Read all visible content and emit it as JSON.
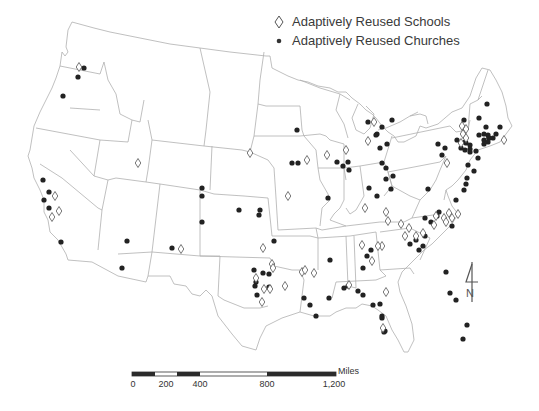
{
  "map": {
    "title": "",
    "region": "Contiguous United States",
    "colors": {
      "state_border": "#b5b5b5",
      "church_marker": "#222222",
      "school_marker": "#555555",
      "text": "#3a3a3a"
    }
  },
  "legend": {
    "items": [
      {
        "symbol": "diamond-outline",
        "label": "Adaptively Reused Schools"
      },
      {
        "symbol": "filled-dot",
        "label": "Adaptively Reused Churches"
      }
    ]
  },
  "scale_bar": {
    "unit": "Miles",
    "ticks": [
      {
        "label": "0",
        "x": 133
      },
      {
        "label": "200",
        "x": 166
      },
      {
        "label": "400",
        "x": 200
      },
      {
        "label": "800",
        "x": 267
      },
      {
        "label": "1,200",
        "x": 334
      }
    ]
  },
  "north_arrow": {
    "label": "N"
  },
  "markers": {
    "churches": [
      [
        84,
        68
      ],
      [
        78,
        77
      ],
      [
        63,
        96
      ],
      [
        43,
        180
      ],
      [
        49,
        192
      ],
      [
        44,
        200
      ],
      [
        49,
        208
      ],
      [
        61,
        242
      ],
      [
        127,
        241
      ],
      [
        122,
        268
      ],
      [
        172,
        248
      ],
      [
        202,
        222
      ],
      [
        202,
        196
      ],
      [
        202,
        188
      ],
      [
        239,
        210
      ],
      [
        260,
        210
      ],
      [
        297,
        130
      ],
      [
        292,
        163
      ],
      [
        298,
        163
      ],
      [
        337,
        162
      ],
      [
        343,
        166
      ],
      [
        348,
        162
      ],
      [
        349,
        170
      ],
      [
        328,
        198
      ],
      [
        304,
        298
      ],
      [
        254,
        270
      ],
      [
        263,
        273
      ],
      [
        256,
        282
      ],
      [
        255,
        286
      ],
      [
        269,
        287
      ],
      [
        269,
        274
      ],
      [
        257,
        295
      ],
      [
        274,
        241
      ],
      [
        259,
        215
      ],
      [
        368,
        122
      ],
      [
        377,
        134
      ],
      [
        376,
        135
      ],
      [
        382,
        127
      ],
      [
        387,
        144
      ],
      [
        386,
        168
      ],
      [
        386,
        179
      ],
      [
        393,
        176
      ],
      [
        391,
        189
      ],
      [
        377,
        196
      ],
      [
        369,
        188
      ],
      [
        382,
        163
      ],
      [
        380,
        148
      ],
      [
        438,
        144
      ],
      [
        457,
        140
      ],
      [
        464,
        120
      ],
      [
        442,
        155
      ],
      [
        445,
        148
      ],
      [
        428,
        189
      ],
      [
        419,
        250
      ],
      [
        363,
        268
      ],
      [
        330,
        260
      ],
      [
        348,
        286
      ],
      [
        344,
        288
      ],
      [
        329,
        298
      ],
      [
        316,
        316
      ],
      [
        310,
        305
      ],
      [
        358,
        291
      ],
      [
        363,
        295
      ],
      [
        373,
        305
      ],
      [
        382,
        316
      ],
      [
        385,
        331
      ],
      [
        446,
        272
      ],
      [
        450,
        293
      ],
      [
        456,
        300
      ],
      [
        463,
        339
      ],
      [
        467,
        325
      ],
      [
        452,
        226
      ],
      [
        423,
        246
      ],
      [
        425,
        218
      ],
      [
        410,
        244
      ],
      [
        487,
        104
      ],
      [
        479,
        118
      ],
      [
        486,
        127
      ],
      [
        488,
        135
      ],
      [
        484,
        134
      ],
      [
        489,
        138
      ],
      [
        493,
        138
      ],
      [
        500,
        127
      ],
      [
        496,
        134
      ],
      [
        465,
        142
      ],
      [
        470,
        152
      ],
      [
        466,
        143
      ],
      [
        470,
        145
      ],
      [
        468,
        165
      ],
      [
        478,
        158
      ],
      [
        474,
        171
      ],
      [
        467,
        178
      ],
      [
        466,
        184
      ],
      [
        464,
        190
      ],
      [
        456,
        200
      ],
      [
        484,
        144
      ],
      [
        484,
        140
      ],
      [
        488,
        142
      ],
      [
        489,
        138
      ],
      [
        479,
        135
      ],
      [
        461,
        148
      ],
      [
        465,
        150
      ],
      [
        470,
        149
      ],
      [
        476,
        151
      ],
      [
        392,
        120
      ],
      [
        416,
        240
      ],
      [
        425,
        236
      ],
      [
        431,
        222
      ],
      [
        437,
        216
      ],
      [
        439,
        212
      ],
      [
        380,
        304
      ],
      [
        382,
        318
      ],
      [
        384,
        332
      ],
      [
        367,
        256
      ],
      [
        371,
        250
      ]
    ],
    "schools": [
      [
        79,
        67
      ],
      [
        55,
        196
      ],
      [
        59,
        211
      ],
      [
        52,
        217
      ],
      [
        138,
        163
      ],
      [
        181,
        249
      ],
      [
        250,
        153
      ],
      [
        288,
        196
      ],
      [
        307,
        160
      ],
      [
        327,
        155
      ],
      [
        346,
        150
      ],
      [
        365,
        208
      ],
      [
        270,
        289
      ],
      [
        256,
        278
      ],
      [
        264,
        289
      ],
      [
        285,
        286
      ],
      [
        272,
        264
      ],
      [
        263,
        248
      ],
      [
        273,
        268
      ],
      [
        262,
        302
      ],
      [
        368,
        141
      ],
      [
        374,
        122
      ],
      [
        302,
        272
      ],
      [
        305,
        270
      ],
      [
        349,
        285
      ],
      [
        362,
        245
      ],
      [
        383,
        328
      ],
      [
        386,
        292
      ],
      [
        372,
        261
      ],
      [
        401,
        224
      ],
      [
        409,
        228
      ],
      [
        416,
        236
      ],
      [
        436,
        216
      ],
      [
        444,
        218
      ],
      [
        449,
        213
      ],
      [
        452,
        218
      ],
      [
        446,
        222
      ],
      [
        434,
        225
      ],
      [
        458,
        214
      ],
      [
        423,
        233
      ],
      [
        405,
        236
      ],
      [
        447,
        163
      ],
      [
        466,
        129
      ],
      [
        463,
        134
      ],
      [
        466,
        138
      ],
      [
        461,
        143
      ],
      [
        504,
        140
      ],
      [
        462,
        126
      ],
      [
        386,
        212
      ],
      [
        388,
        221
      ],
      [
        382,
        246
      ],
      [
        378,
        246
      ],
      [
        314,
        273
      ]
    ]
  }
}
